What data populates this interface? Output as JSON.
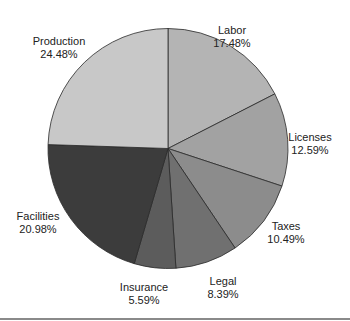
{
  "chart_data": {
    "type": "pie",
    "title": "",
    "start_angle_deg": 0,
    "direction": "clockwise",
    "center": [
      168,
      148.5
    ],
    "radius": 120,
    "slices": [
      {
        "label": "Labor",
        "value": 17.48,
        "value_text": "17.48%",
        "color": "#b4b4b4",
        "label_pos": [
          232,
          24
        ]
      },
      {
        "label": "Licenses",
        "value": 12.59,
        "value_text": "12.59%",
        "color": "#a2a2a2",
        "label_pos": [
          310,
          131
        ]
      },
      {
        "label": "Taxes",
        "value": 10.49,
        "value_text": "10.49%",
        "color": "#8c8c8c",
        "label_pos": [
          286,
          220
        ]
      },
      {
        "label": "Legal",
        "value": 8.39,
        "value_text": "8.39%",
        "color": "#707070",
        "label_pos": [
          223,
          275
        ]
      },
      {
        "label": "Insurance",
        "value": 5.59,
        "value_text": "5.59%",
        "color": "#5c5c5c",
        "label_pos": [
          144,
          281
        ]
      },
      {
        "label": "Facilities",
        "value": 20.98,
        "value_text": "20.98%",
        "color": "#3c3c3c",
        "label_pos": [
          38,
          210
        ]
      },
      {
        "label": "Production",
        "value": 24.48,
        "value_text": "24.48%",
        "color": "#c8c8c8",
        "label_pos": [
          59,
          35
        ]
      }
    ],
    "legend": "none (inline labels)"
  }
}
